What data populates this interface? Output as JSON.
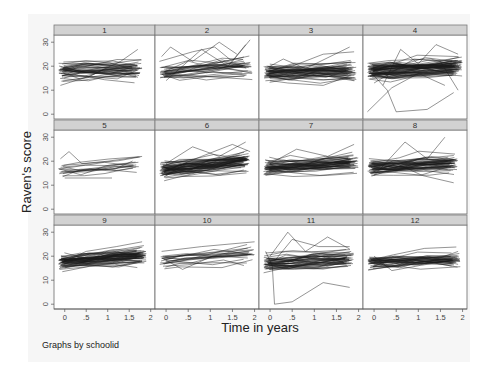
{
  "chart_data": {
    "type": "line",
    "layout": "trellis 3x4 (by schoolid)",
    "ylabel": "Raven's score",
    "xlabel": "Time in years",
    "note": "Graphs by schoolid",
    "xticks": [
      0,
      0.5,
      1,
      1.5,
      2
    ],
    "xtick_labels": [
      "0",
      ".5",
      "1",
      "1.5",
      "2"
    ],
    "yticks": [
      0,
      10,
      20,
      30
    ],
    "ytick_labels": [
      "0",
      "10",
      "20",
      "30"
    ],
    "xlim": [
      -0.25,
      2.1
    ],
    "ylim": [
      -2,
      33
    ],
    "panels": [
      {
        "label": "1",
        "n": 40,
        "mean_start": 18,
        "slope": 0.5,
        "spread": 3.0,
        "tmax": 1.8,
        "outliers": [
          [
            [
              -0.1,
              12
            ],
            [
              0.6,
              16
            ],
            [
              1.3,
              22
            ],
            [
              1.7,
              27
            ]
          ]
        ]
      },
      {
        "label": "2",
        "n": 30,
        "mean_start": 18,
        "slope": 1.0,
        "spread": 3.0,
        "tmax": 1.95,
        "outliers": [
          [
            [
              -0.1,
              24
            ],
            [
              0.1,
              28
            ],
            [
              0.6,
              22
            ],
            [
              1.2,
              30
            ],
            [
              1.6,
              25
            ]
          ],
          [
            [
              -0.15,
              22
            ],
            [
              0.6,
              26
            ],
            [
              1.1,
              28
            ],
            [
              1.5,
              22
            ],
            [
              1.9,
              31
            ]
          ],
          [
            [
              0.0,
              14
            ],
            [
              0.8,
              27
            ],
            [
              1.4,
              20
            ],
            [
              1.8,
              29
            ]
          ]
        ]
      },
      {
        "label": "3",
        "n": 50,
        "mean_start": 17,
        "slope": 0.5,
        "spread": 2.8,
        "tmax": 1.95,
        "outliers": [
          [
            [
              0.0,
              20
            ],
            [
              0.3,
              23
            ],
            [
              0.8,
              19
            ],
            [
              1.8,
              28
            ]
          ],
          [
            [
              0.0,
              18
            ],
            [
              0.5,
              20
            ],
            [
              1.2,
              25
            ],
            [
              1.9,
              26
            ]
          ],
          [
            [
              0.0,
              14
            ],
            [
              0.4,
              13
            ],
            [
              1.2,
              12
            ],
            [
              1.8,
              16
            ]
          ]
        ]
      },
      {
        "label": "4",
        "n": 70,
        "mean_start": 18,
        "slope": 1.0,
        "spread": 3.0,
        "tmax": 2.0,
        "outliers": [
          [
            [
              -0.1,
              18
            ],
            [
              0.3,
              10
            ],
            [
              0.5,
              1
            ],
            [
              1.2,
              2
            ],
            [
              1.8,
              9
            ]
          ],
          [
            [
              -0.15,
              1
            ],
            [
              0.4,
              11
            ],
            [
              1.0,
              17
            ],
            [
              1.6,
              12
            ]
          ],
          [
            [
              0.2,
              12
            ],
            [
              0.6,
              27
            ],
            [
              1.0,
              21
            ],
            [
              1.4,
              29
            ],
            [
              1.9,
              25
            ]
          ],
          [
            [
              0.0,
              13
            ],
            [
              0.9,
              23
            ],
            [
              1.5,
              22
            ],
            [
              1.9,
              10
            ]
          ]
        ]
      },
      {
        "label": "5",
        "n": 14,
        "mean_start": 16,
        "slope": 1.5,
        "spread": 2.5,
        "tmax": 1.8,
        "outliers": [
          [
            [
              -0.1,
              21
            ],
            [
              0.1,
              24
            ],
            [
              0.4,
              19
            ],
            [
              1.0,
              20
            ],
            [
              1.8,
              22
            ]
          ],
          [
            [
              0.0,
              13
            ],
            [
              0.4,
              13
            ],
            [
              1.1,
              13
            ]
          ]
        ]
      },
      {
        "label": "6",
        "n": 60,
        "mean_start": 16.5,
        "slope": 2.0,
        "spread": 2.6,
        "tmax": 1.9,
        "outliers": [
          [
            [
              0.0,
              19
            ],
            [
              0.6,
              26
            ],
            [
              1.2,
              22
            ],
            [
              1.8,
              28
            ]
          ],
          [
            [
              0.0,
              16
            ],
            [
              0.8,
              22
            ],
            [
              1.5,
              27
            ],
            [
              1.9,
              24
            ]
          ]
        ]
      },
      {
        "label": "7",
        "n": 50,
        "mean_start": 17.5,
        "slope": 1.0,
        "spread": 2.7,
        "tmax": 2.0,
        "outliers": [
          [
            [
              0.0,
              19
            ],
            [
              0.6,
              25
            ],
            [
              1.3,
              22
            ],
            [
              1.9,
              27
            ]
          ]
        ]
      },
      {
        "label": "8",
        "n": 50,
        "mean_start": 17.5,
        "slope": 1.0,
        "spread": 3.0,
        "tmax": 1.9,
        "outliers": [
          [
            [
              0.0,
              14
            ],
            [
              0.7,
              28
            ],
            [
              1.2,
              21
            ],
            [
              1.6,
              30
            ]
          ],
          [
            [
              0.0,
              16
            ],
            [
              0.5,
              19
            ],
            [
              1.1,
              14
            ],
            [
              1.8,
              11
            ]
          ]
        ]
      },
      {
        "label": "9",
        "n": 60,
        "mean_start": 17.5,
        "slope": 1.5,
        "spread": 2.7,
        "tmax": 1.9,
        "outliers": [
          [
            [
              0.0,
              18
            ],
            [
              0.5,
              22
            ],
            [
              1.2,
              24
            ],
            [
              1.8,
              26
            ]
          ]
        ]
      },
      {
        "label": "10",
        "n": 20,
        "mean_start": 18,
        "slope": 1.5,
        "spread": 3.2,
        "tmax": 2.0,
        "outliers": [
          [
            [
              -0.1,
              22
            ],
            [
              0.8,
              24
            ],
            [
              2.0,
              26
            ]
          ]
        ]
      },
      {
        "label": "11",
        "n": 45,
        "mean_start": 17,
        "slope": 1.0,
        "spread": 2.6,
        "tmax": 1.9,
        "outliers": [
          [
            [
              -0.1,
              22
            ],
            [
              0.05,
              16
            ],
            [
              0.1,
              0
            ],
            [
              0.5,
              1
            ],
            [
              1.2,
              9
            ],
            [
              1.8,
              7
            ]
          ],
          [
            [
              0.0,
              20
            ],
            [
              0.4,
              30
            ],
            [
              0.8,
              22
            ],
            [
              1.3,
              28
            ],
            [
              1.8,
              23
            ]
          ],
          [
            [
              0.1,
              18
            ],
            [
              0.5,
              27
            ],
            [
              1.1,
              24
            ],
            [
              1.8,
              24
            ]
          ]
        ]
      },
      {
        "label": "12",
        "n": 40,
        "mean_start": 17.5,
        "slope": 0.8,
        "spread": 2.6,
        "tmax": 1.95,
        "outliers": [
          [
            [
              0.0,
              20
            ],
            [
              0.4,
              14
            ],
            [
              1.0,
              16
            ],
            [
              1.9,
              22
            ]
          ]
        ]
      }
    ],
    "grid": false,
    "legend": "none"
  },
  "colors": {
    "strip_fill": "#d2d2d2",
    "line": "#1a1a1a",
    "plot_bg": "#ffffff",
    "outer_bg": "#f6f6f6"
  }
}
